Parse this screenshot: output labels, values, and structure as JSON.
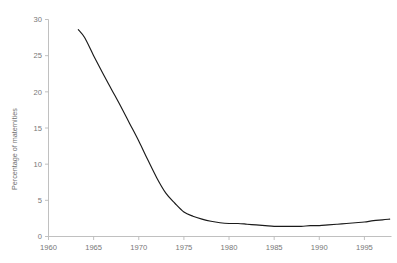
{
  "chart_data": {
    "type": "line",
    "title": "",
    "subtitle": "",
    "xlabel": "",
    "ylabel": "Percentage of maternities",
    "xlim": [
      1960,
      1998
    ],
    "ylim": [
      0,
      30
    ],
    "grid": false,
    "legend": false,
    "legend_position": "none",
    "xticks": [
      1960,
      1965,
      1970,
      1975,
      1980,
      1985,
      1990,
      1995
    ],
    "xtick_labels": [
      "1960",
      "1965",
      "1970",
      "1975",
      "1980",
      "1985",
      "1990",
      "1995"
    ],
    "yticks": [
      0,
      5,
      10,
      15,
      20,
      25,
      30
    ],
    "ytick_labels": [
      "0",
      "5",
      "10",
      "15",
      "20",
      "25",
      "30"
    ],
    "line_color": "#1a1a1a",
    "axis_color": "#b9b9b9",
    "text_color": "#6f6f6f",
    "series": [
      {
        "name": "Percentage of maternities",
        "x": [
          1963.3,
          1964,
          1965,
          1966,
          1967,
          1968,
          1969,
          1970,
          1971,
          1972,
          1973,
          1974,
          1975,
          1976,
          1977,
          1978,
          1979,
          1980,
          1981,
          1982,
          1983,
          1984,
          1985,
          1986,
          1987,
          1988,
          1989,
          1990,
          1991,
          1992,
          1993,
          1994,
          1995,
          1996,
          1997,
          1997.8
        ],
        "values": [
          28.6,
          27.5,
          25.0,
          22.6,
          20.3,
          18.0,
          15.6,
          13.2,
          10.6,
          8.1,
          6.0,
          4.6,
          3.4,
          2.8,
          2.4,
          2.1,
          1.9,
          1.8,
          1.8,
          1.7,
          1.6,
          1.5,
          1.4,
          1.4,
          1.4,
          1.4,
          1.5,
          1.5,
          1.6,
          1.7,
          1.8,
          1.9,
          2.0,
          2.2,
          2.3,
          2.4
        ]
      }
    ],
    "annotations": []
  },
  "top_fragment": {
    "left": "",
    "middle": ""
  }
}
